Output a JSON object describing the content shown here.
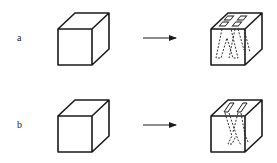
{
  "rows": [
    {
      "label": "a",
      "before": "solid cube",
      "after": "cube with two inverted-V channels (four openings on top)"
    },
    {
      "label": "b",
      "before": "solid cube",
      "after": "cube with one inverted-V channel (two openings on top)"
    }
  ],
  "colors": {
    "stroke": "#1a1a1a",
    "background": "#ffffff"
  }
}
